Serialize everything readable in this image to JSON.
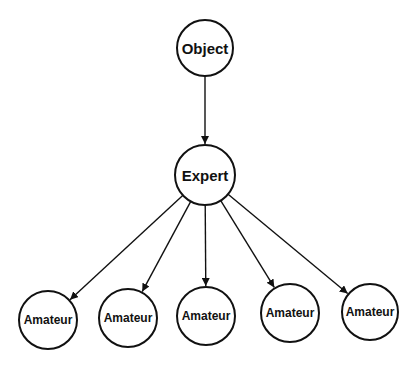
{
  "diagram": {
    "type": "tree",
    "colors": {
      "stroke": "#111111",
      "fill": "#ffffff",
      "background": "#ffffff"
    },
    "nodes": [
      {
        "id": "object",
        "label": "Object",
        "cx": 205,
        "cy": 48,
        "r": 28,
        "font_size": 15
      },
      {
        "id": "expert",
        "label": "Expert",
        "cx": 205,
        "cy": 175,
        "r": 30,
        "font_size": 15
      },
      {
        "id": "amateur1",
        "label": "Amateur",
        "cx": 48,
        "cy": 320,
        "r": 29,
        "font_size": 12
      },
      {
        "id": "amateur2",
        "label": "Amateur",
        "cx": 128,
        "cy": 318,
        "r": 29,
        "font_size": 12
      },
      {
        "id": "amateur3",
        "label": "Amateur",
        "cx": 206,
        "cy": 316,
        "r": 29,
        "font_size": 12
      },
      {
        "id": "amateur4",
        "label": "Amateur",
        "cx": 290,
        "cy": 313,
        "r": 29,
        "font_size": 12
      },
      {
        "id": "amateur5",
        "label": "Amateur",
        "cx": 370,
        "cy": 312,
        "r": 28,
        "font_size": 12
      }
    ],
    "edges": [
      {
        "from": "object",
        "to": "expert"
      },
      {
        "from": "expert",
        "to": "amateur1"
      },
      {
        "from": "expert",
        "to": "amateur2"
      },
      {
        "from": "expert",
        "to": "amateur3"
      },
      {
        "from": "expert",
        "to": "amateur4"
      },
      {
        "from": "expert",
        "to": "amateur5"
      }
    ]
  }
}
